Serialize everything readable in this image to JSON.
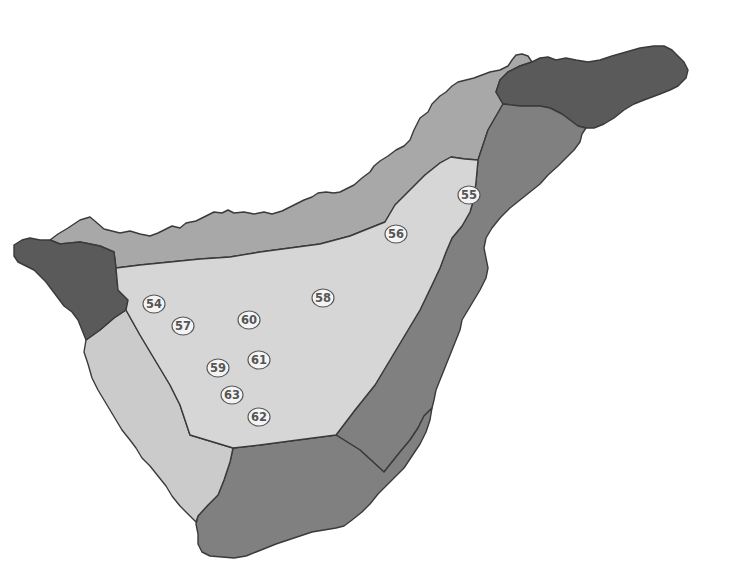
{
  "map": {
    "subject": "Island map divided into shaded zones with numbered site markers",
    "colors": {
      "background": "#ffffff",
      "zone_darkest": "#5a5a5a",
      "zone_dark": "#808080",
      "zone_mid": "#a8a8a8",
      "zone_light": "#cbcbcb",
      "zone_central": "#d6d6d6",
      "border": "#3a3a3a",
      "marker_fill": "#f4f4f4",
      "marker_text": "#555555"
    },
    "zones": [
      {
        "id": "northeast-peninsula",
        "shade": "darkest"
      },
      {
        "id": "northwest-tip",
        "shade": "darkest"
      },
      {
        "id": "north-coast",
        "shade": "mid"
      },
      {
        "id": "east-coast",
        "shade": "dark"
      },
      {
        "id": "south-coast",
        "shade": "dark"
      },
      {
        "id": "west-coast",
        "shade": "light"
      },
      {
        "id": "central-highlands",
        "shade": "central"
      }
    ],
    "markers": [
      {
        "label": "54",
        "x": 154,
        "y": 304
      },
      {
        "label": "55",
        "x": 469,
        "y": 195
      },
      {
        "label": "56",
        "x": 396,
        "y": 234
      },
      {
        "label": "57",
        "x": 183,
        "y": 326
      },
      {
        "label": "58",
        "x": 323,
        "y": 298
      },
      {
        "label": "59",
        "x": 218,
        "y": 368
      },
      {
        "label": "60",
        "x": 249,
        "y": 320
      },
      {
        "label": "61",
        "x": 259,
        "y": 360
      },
      {
        "label": "62",
        "x": 259,
        "y": 417
      },
      {
        "label": "63",
        "x": 232,
        "y": 395
      }
    ]
  }
}
